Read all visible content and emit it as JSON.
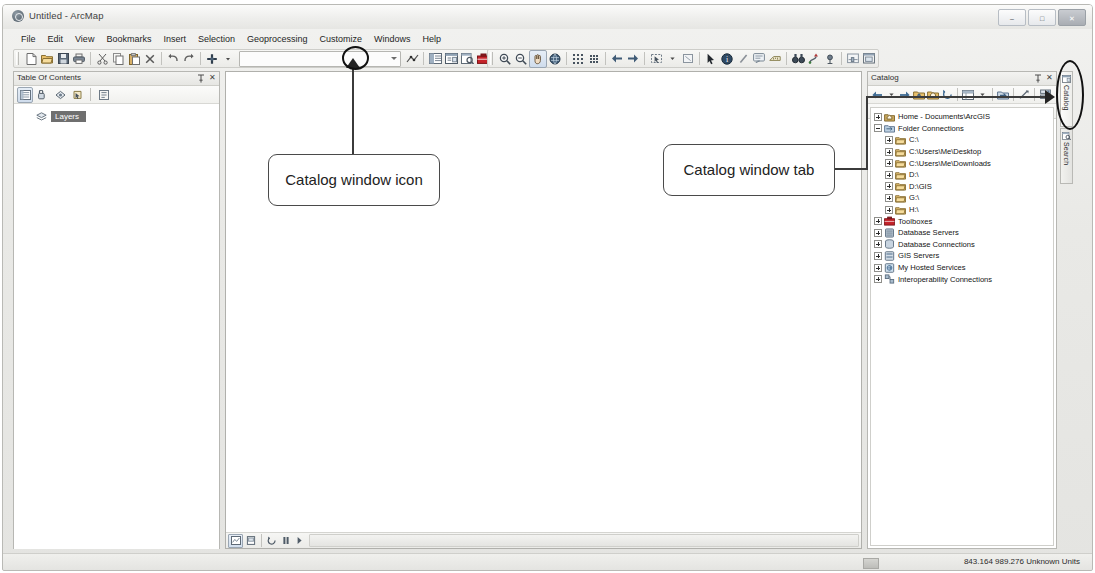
{
  "window": {
    "title": "Untitled - ArcMap",
    "app_icon": "arcmap-globe-icon",
    "controls": {
      "minimize": "–",
      "maximize": "□",
      "close": "✕"
    }
  },
  "menubar": {
    "items": [
      {
        "label": "File"
      },
      {
        "label": "Edit"
      },
      {
        "label": "View"
      },
      {
        "label": "Bookmarks"
      },
      {
        "label": "Insert"
      },
      {
        "label": "Selection"
      },
      {
        "label": "Geoprocessing"
      },
      {
        "label": "Customize"
      },
      {
        "label": "Windows"
      },
      {
        "label": "Help"
      }
    ]
  },
  "standard_toolbar": {
    "name": "Standard",
    "scale_combo_value": "",
    "buttons": [
      {
        "icon": "new-document-icon",
        "tip": "New"
      },
      {
        "icon": "open-folder-icon",
        "tip": "Open"
      },
      {
        "icon": "save-disk-icon",
        "tip": "Save"
      },
      {
        "icon": "print-icon",
        "tip": "Print"
      },
      {
        "icon": "cut-scissors-icon",
        "tip": "Cut"
      },
      {
        "icon": "copy-icon",
        "tip": "Copy"
      },
      {
        "icon": "paste-icon",
        "tip": "Paste"
      },
      {
        "icon": "delete-x-icon",
        "tip": "Delete"
      },
      {
        "icon": "undo-arrow-icon",
        "tip": "Undo"
      },
      {
        "icon": "redo-arrow-icon",
        "tip": "Redo"
      },
      {
        "icon": "add-data-icon",
        "tip": "Add Data"
      },
      {
        "icon": "editor-toolbar-icon",
        "tip": "Editor Toolbar"
      },
      {
        "icon": "table-of-contents-icon",
        "tip": "Table Of Contents"
      },
      {
        "icon": "catalog-window-icon",
        "tip": "Catalog Window"
      },
      {
        "icon": "search-window-icon",
        "tip": "Search Window"
      },
      {
        "icon": "arctoolbox-icon",
        "tip": "ArcToolbox"
      },
      {
        "icon": "python-window-icon",
        "tip": "Python Window"
      },
      {
        "icon": "model-builder-icon",
        "tip": "ModelBuilder"
      }
    ]
  },
  "tools_toolbar": {
    "name": "Tools",
    "buttons": [
      {
        "icon": "zoom-in-icon",
        "tip": "Zoom In"
      },
      {
        "icon": "zoom-out-icon",
        "tip": "Zoom Out"
      },
      {
        "icon": "pan-hand-icon",
        "tip": "Pan",
        "selected": true
      },
      {
        "icon": "full-extent-globe-icon",
        "tip": "Full Extent"
      },
      {
        "icon": "fixed-zoom-in-icon",
        "tip": "Fixed Zoom In"
      },
      {
        "icon": "fixed-zoom-out-icon",
        "tip": "Fixed Zoom Out"
      },
      {
        "icon": "back-extent-arrow-icon",
        "tip": "Go Back To Previous Extent"
      },
      {
        "icon": "forward-extent-arrow-icon",
        "tip": "Go To Next Extent"
      },
      {
        "icon": "select-features-icon",
        "tip": "Select Features"
      },
      {
        "icon": "clear-selection-icon",
        "tip": "Clear Selected Features"
      },
      {
        "icon": "select-elements-arrow-icon",
        "tip": "Select Elements"
      },
      {
        "icon": "identify-icon",
        "tip": "Identify"
      },
      {
        "icon": "hyperlink-icon",
        "tip": "Hyperlink"
      },
      {
        "icon": "html-popup-icon",
        "tip": "HTML Popup"
      },
      {
        "icon": "measure-icon",
        "tip": "Measure"
      },
      {
        "icon": "find-binoculars-icon",
        "tip": "Find"
      },
      {
        "icon": "find-route-icon",
        "tip": "Find Route"
      },
      {
        "icon": "go-to-xy-icon",
        "tip": "Go To XY"
      },
      {
        "icon": "time-slider-icon",
        "tip": "Time Slider"
      },
      {
        "icon": "create-viewer-window-icon",
        "tip": "Create Viewer Window"
      }
    ]
  },
  "table_of_contents": {
    "title": "Table Of Contents",
    "pin_icon": "pin-icon",
    "close_icon": "close-icon",
    "tools": [
      {
        "icon": "list-by-drawing-order-icon",
        "selected": true
      },
      {
        "icon": "list-by-source-icon"
      },
      {
        "icon": "list-by-visibility-icon"
      },
      {
        "icon": "list-by-selection-icon"
      },
      {
        "icon": "options-icon"
      }
    ],
    "tree": [
      {
        "label": "Layers",
        "icon": "layers-icon",
        "selected": true
      }
    ]
  },
  "map_view": {
    "view_buttons": [
      {
        "icon": "data-view-icon",
        "selected": true
      },
      {
        "icon": "layout-view-icon"
      },
      {
        "icon": "refresh-view-icon"
      },
      {
        "icon": "pause-drawing-icon"
      },
      {
        "icon": "next-page-icon"
      }
    ],
    "scrollbar": "horizontal-scrollbar"
  },
  "catalog": {
    "title": "Catalog",
    "pin_icon": "pin-icon",
    "close_icon": "close-icon",
    "tools": [
      {
        "icon": "back-arrow-icon"
      },
      {
        "icon": "back-dropdown-icon"
      },
      {
        "icon": "forward-arrow-icon"
      },
      {
        "icon": "up-one-level-icon"
      },
      {
        "icon": "home-folder-icon"
      },
      {
        "icon": "refresh-icon"
      },
      {
        "icon": "catalog-tree-view-icon"
      },
      {
        "icon": "view-dropdown-icon"
      },
      {
        "icon": "connect-to-folder-icon"
      },
      {
        "icon": "toggle-contents-panel-icon"
      },
      {
        "icon": "organize-favorites-icon"
      }
    ],
    "location": {
      "label": "Location:",
      "icon": "home-folder-icon",
      "value": "Home - Documents\\ArcGIS",
      "dropdown_icon": "chevron-down-icon"
    },
    "tree": [
      {
        "label": "Home - Documents\\ArcGIS",
        "icon": "home-folder-icon",
        "depth": 0,
        "expander": "plus"
      },
      {
        "label": "Folder Connections",
        "icon": "folder-connections-icon",
        "depth": 0,
        "expander": "minus"
      },
      {
        "label": "C:\\",
        "icon": "folder-icon",
        "depth": 1,
        "expander": "plus"
      },
      {
        "label": "C:\\Users\\Me\\Desktop",
        "icon": "folder-icon",
        "depth": 1,
        "expander": "plus"
      },
      {
        "label": "C:\\Users\\Me\\Downloads",
        "icon": "folder-icon",
        "depth": 1,
        "expander": "plus"
      },
      {
        "label": "D:\\",
        "icon": "folder-icon",
        "depth": 1,
        "expander": "plus"
      },
      {
        "label": "D:\\GIS",
        "icon": "folder-icon",
        "depth": 1,
        "expander": "plus"
      },
      {
        "label": "G:\\",
        "icon": "folder-icon",
        "depth": 1,
        "expander": "plus"
      },
      {
        "label": "H:\\",
        "icon": "folder-icon",
        "depth": 1,
        "expander": "plus"
      },
      {
        "label": "Toolboxes",
        "icon": "toolboxes-icon",
        "depth": 0,
        "expander": "plus"
      },
      {
        "label": "Database Servers",
        "icon": "database-servers-icon",
        "depth": 0,
        "expander": "plus"
      },
      {
        "label": "Database Connections",
        "icon": "database-connections-icon",
        "depth": 0,
        "expander": "plus"
      },
      {
        "label": "GIS Servers",
        "icon": "gis-servers-icon",
        "depth": 0,
        "expander": "plus"
      },
      {
        "label": "My Hosted Services",
        "icon": "my-hosted-services-icon",
        "depth": 0,
        "expander": "plus"
      },
      {
        "label": "Interoperability Connections",
        "icon": "interoperability-connections-icon",
        "depth": 0,
        "expander": "plus"
      }
    ]
  },
  "side_tabs": [
    {
      "label": "Catalog",
      "icon": "catalog-window-icon",
      "active": true
    },
    {
      "label": "Search",
      "icon": "search-window-icon",
      "active": false
    }
  ],
  "status_bar": {
    "coordinates": "843.164  989.276 Unknown Units"
  },
  "annotations": [
    {
      "id": "callout-catalog-window-icon",
      "text": "Catalog window icon"
    },
    {
      "id": "callout-catalog-window-tab",
      "text": "Catalog window tab"
    }
  ]
}
